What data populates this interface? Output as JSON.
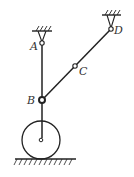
{
  "diagram": {
    "type": "mechanism",
    "labels": {
      "A": "A",
      "B": "B",
      "C": "C",
      "D": "D"
    },
    "colors": {
      "line": "#222222",
      "background": "#ffffff"
    }
  }
}
